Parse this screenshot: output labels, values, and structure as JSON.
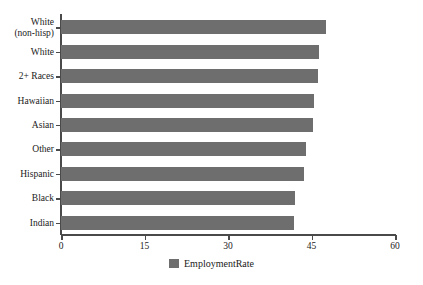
{
  "chart_data": {
    "type": "bar",
    "orientation": "horizontal",
    "title": "",
    "xlabel": "",
    "ylabel": "",
    "xlim": [
      0,
      60
    ],
    "xticks": [
      0,
      15,
      30,
      45,
      60
    ],
    "grid": false,
    "legend_position": "bottom-center",
    "series_name": "EmploymentRate",
    "series_color": "#6e6e6e",
    "axis_color": "#4a4a4a",
    "background_color": "#ffffff",
    "categories": [
      "White (non-hisp)",
      "White",
      "2+ Races",
      "Hawaiian",
      "Asian",
      "Other",
      "Hispanic",
      "Black",
      "Indian"
    ],
    "category_lines": [
      [
        "White",
        "(non-hisp)"
      ],
      [
        "White",
        ""
      ],
      [
        "2+ Races",
        ""
      ],
      [
        "Hawaiian",
        ""
      ],
      [
        "Asian",
        ""
      ],
      [
        "Other",
        ""
      ],
      [
        "Hispanic",
        ""
      ],
      [
        "Black",
        ""
      ],
      [
        "Indian",
        ""
      ]
    ],
    "values": [
      47.6,
      46.4,
      46.2,
      45.4,
      45.2,
      44.0,
      43.7,
      42.0,
      41.9
    ],
    "series": [
      {
        "name": "EmploymentRate",
        "values": [
          47.6,
          46.4,
          46.2,
          45.4,
          45.2,
          44.0,
          43.7,
          42.0,
          41.9
        ]
      }
    ]
  },
  "legend": {
    "label": "EmploymentRate"
  },
  "axis": {
    "x_tick_labels": [
      "0",
      "15",
      "30",
      "45",
      "60"
    ]
  }
}
